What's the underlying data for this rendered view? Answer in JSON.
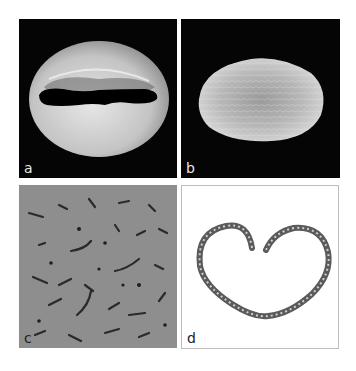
{
  "figure": {
    "panels": [
      {
        "id": "a",
        "label": "a",
        "description": "SEM image of pollen grain with slit aperture on black background"
      },
      {
        "id": "b",
        "label": "b",
        "description": "SEM image of ellipsoid textured pollen grain on black background"
      },
      {
        "id": "c",
        "label": "c",
        "description": "Close-up of grey perforated surface texture"
      },
      {
        "id": "d",
        "label": "d",
        "description": "Heart-shaped outline section on white background"
      }
    ],
    "colors": {
      "background": "#ffffff",
      "sem_background": "#050505",
      "surface_grey": "#8e8e8e",
      "panel_border": "#bdbdbd"
    }
  }
}
